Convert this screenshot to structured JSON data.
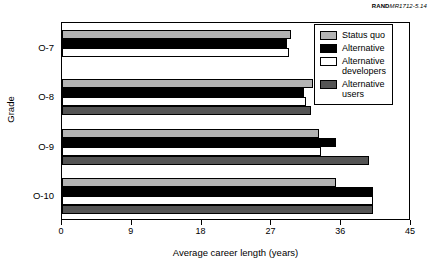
{
  "credit": {
    "brand": "RAND",
    "number": "MR1712-5.14"
  },
  "chart_data": {
    "type": "bar",
    "orientation": "horizontal",
    "title": "",
    "xlabel": "Average career length (years)",
    "ylabel": "Grade",
    "categories": [
      "O-7",
      "O-8",
      "O-9",
      "O-10"
    ],
    "xlim": [
      0,
      45
    ],
    "xticks": [
      0,
      9,
      18,
      27,
      36,
      45
    ],
    "grid": false,
    "legend_position": "top-right",
    "series": [
      {
        "name": "Status quo",
        "color": "#b3b3b3",
        "values": [
          29.5,
          32.3,
          33.1,
          35.3
        ]
      },
      {
        "name": "Alternative",
        "color": "#000000",
        "values": [
          29.0,
          31.2,
          35.3,
          40.1
        ]
      },
      {
        "name": "Alternative developers",
        "color": "#ffffff",
        "values": [
          29.3,
          31.4,
          33.4,
          40.1
        ]
      },
      {
        "name": "Alternative users",
        "color": "#545454",
        "values": [
          0,
          32.1,
          39.6,
          40.1
        ]
      }
    ]
  }
}
